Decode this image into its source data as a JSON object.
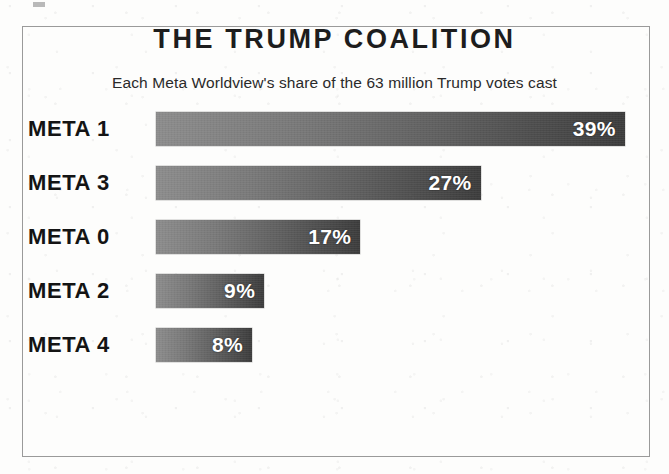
{
  "chart_data": {
    "type": "bar",
    "orientation": "horizontal",
    "title": "THE TRUMP COALITION",
    "subtitle": "Each Meta Worldview's share of the 63 million Trump votes cast",
    "xlabel": "",
    "ylabel": "",
    "xlim": [
      0,
      42
    ],
    "grid": false,
    "legend": null,
    "value_suffix": "%",
    "categories": [
      "META 1",
      "META 3",
      "META 0",
      "META 2",
      "META 4"
    ],
    "values": [
      39,
      27,
      17,
      9,
      8
    ],
    "bars": [
      {
        "label": "META 1",
        "value": 39,
        "value_label": "39%"
      },
      {
        "label": "META 3",
        "value": 27,
        "value_label": "27%"
      },
      {
        "label": "META 0",
        "value": 17,
        "value_label": "17%"
      },
      {
        "label": "META 2",
        "value": 9,
        "value_label": "9%"
      },
      {
        "label": "META 4",
        "value": 8,
        "value_label": "8%"
      }
    ],
    "colors": {
      "bar_gradient_start": "#8c8c8c",
      "bar_gradient_end": "#3c3c3c",
      "value_label": "#ffffff",
      "category_label": "#141414",
      "title": "#1d1d1d",
      "background": "#fdfdfc",
      "frame_border": "#9a9a9a"
    }
  }
}
